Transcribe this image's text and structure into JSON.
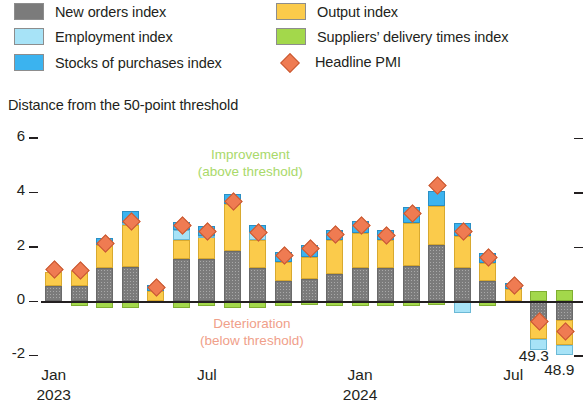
{
  "legend": {
    "items": [
      {
        "label": "New orders index",
        "key": "neworders",
        "color": "#7b7b7b",
        "icon": "square-swatch",
        "col": 0,
        "row": 0
      },
      {
        "label": "Employment index",
        "key": "employment",
        "color": "#a7e3f7",
        "icon": "square-swatch",
        "col": 0,
        "row": 1
      },
      {
        "label": "Stocks of purchases index",
        "key": "stocks",
        "color": "#3bb3ef",
        "icon": "square-swatch",
        "col": 0,
        "row": 2
      },
      {
        "label": "Output index",
        "key": "output",
        "color": "#fbcb4b",
        "icon": "square-swatch",
        "col": 1,
        "row": 0
      },
      {
        "label": "Suppliers’ delivery times index",
        "key": "suppliers",
        "color": "#a3d84b",
        "icon": "square-swatch",
        "col": 1,
        "row": 1
      },
      {
        "label": "Headline PMI",
        "key": "pmi",
        "color": "#ef7b52",
        "icon": "diamond-marker",
        "col": 1,
        "row": 2
      }
    ]
  },
  "annotations": {
    "improvement": {
      "line1": "Improvement",
      "line2": "(above threshold)",
      "color": "#a9d96a"
    },
    "deterioration": {
      "line1": "Deterioration",
      "line2": "(below threshold)",
      "color": "#f0a08a"
    }
  },
  "data_labels": [
    {
      "text": "49.3",
      "index": 19
    },
    {
      "text": "48.9",
      "index": 20
    }
  ],
  "chart_data": {
    "type": "bar",
    "subtype": "stacked-bar-with-marker",
    "title": "Distance from the 50-point threshold",
    "ylabel": "Distance from the 50-point threshold",
    "xlabel": "",
    "ylim": [
      -2,
      6
    ],
    "yticks": [
      -2,
      0,
      2,
      4,
      6
    ],
    "ytick_labels": [
      "-2",
      "0",
      "2",
      "4",
      "6"
    ],
    "grid": false,
    "legend_position": "top",
    "zero_reference_line": 0,
    "x": [
      "Jan 2023",
      "Feb 2023",
      "Mar 2023",
      "Apr 2023",
      "May 2023",
      "Jun 2023",
      "Jul 2023",
      "Aug 2023",
      "Sep 2023",
      "Oct 2023",
      "Nov 2023",
      "Dec 2023",
      "Jan 2024",
      "Feb 2024",
      "Mar 2024",
      "Apr 2024",
      "May 2024",
      "Jun 2024",
      "Jul 2024",
      "Aug 2024",
      "Sep 2024"
    ],
    "xtick_labels": [
      {
        "label": "Jan",
        "year": "2023",
        "index": 0
      },
      {
        "label": "Jul",
        "year": "",
        "index": 6
      },
      {
        "label": "Jan",
        "year": "2024",
        "index": 12
      },
      {
        "label": "Jul",
        "year": "",
        "index": 18
      }
    ],
    "series": [
      {
        "name": "New orders index",
        "key": "neworders",
        "color": "#7b7b7b",
        "values": [
          0.55,
          0.55,
          1.2,
          1.25,
          0.0,
          1.55,
          1.55,
          1.85,
          1.2,
          0.75,
          0.8,
          1.0,
          1.2,
          1.2,
          1.3,
          2.05,
          1.2,
          0.75,
          0.0,
          -0.75,
          -0.7
        ]
      },
      {
        "name": "Output index",
        "key": "output",
        "color": "#fbcb4b",
        "values": [
          0.5,
          0.55,
          0.85,
          1.55,
          0.35,
          0.7,
          0.8,
          1.7,
          1.05,
          0.7,
          0.8,
          1.25,
          1.3,
          1.05,
          1.55,
          1.45,
          1.2,
          0.65,
          0.45,
          -0.65,
          -0.9
        ]
      },
      {
        "name": "Employment index",
        "key": "employment",
        "color": "#a7e3f7",
        "values": [
          0.0,
          0.0,
          0.0,
          0.05,
          0.0,
          0.35,
          0.05,
          0.0,
          0.3,
          0.0,
          0.0,
          0.0,
          0.0,
          0.0,
          0.0,
          0.0,
          -0.45,
          0.0,
          0.0,
          -0.4,
          -0.4
        ]
      },
      {
        "name": "Stocks of purchases index",
        "key": "stocks",
        "color": "#3bb3ef",
        "values": [
          0.0,
          0.0,
          0.25,
          0.45,
          0.25,
          0.3,
          0.35,
          0.4,
          0.25,
          0.35,
          0.45,
          0.35,
          0.45,
          0.35,
          0.6,
          0.55,
          0.45,
          0.35,
          0.2,
          0.0,
          0.0
        ]
      },
      {
        "name": "Suppliers’ delivery times index",
        "key": "suppliers",
        "color": "#a3d84b",
        "values": [
          0.0,
          -0.2,
          -0.25,
          -0.25,
          0.0,
          -0.25,
          -0.2,
          -0.25,
          -0.25,
          -0.2,
          -0.15,
          -0.2,
          -0.2,
          -0.2,
          -0.2,
          -0.15,
          0.0,
          -0.2,
          0.0,
          0.35,
          0.4
        ]
      }
    ],
    "marker_series": {
      "name": "Headline PMI",
      "key": "pmi",
      "color": "#ef7b52",
      "marker": "diamond",
      "values": [
        1.2,
        1.15,
        2.15,
        2.95,
        0.55,
        2.8,
        2.6,
        3.7,
        2.55,
        1.7,
        1.95,
        2.5,
        2.8,
        2.45,
        3.25,
        4.3,
        2.6,
        1.65,
        0.6,
        -0.7,
        -1.1
      ]
    }
  }
}
